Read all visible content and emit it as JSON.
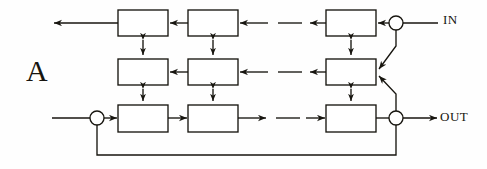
{
  "figure": {
    "panel_label": "A",
    "type": "block-diagram",
    "background": "#fefefe",
    "stroke_color": "#17150f",
    "fill_color": "#ffffff",
    "width": 487,
    "height": 169
  },
  "labels": {
    "input": "IN",
    "output": "OUT",
    "panel": "A"
  },
  "structure": {
    "rows": 3,
    "columns_drawn": 3,
    "row_names": [
      "top-row",
      "middle-row",
      "bottom-row"
    ],
    "top_row_direction": "right-to-left",
    "middle_row_direction": "right-to-left",
    "bottom_row_direction": "left-to-right",
    "ellipsis_marker": "dash",
    "vertical_links": "double-headed-arrow",
    "summing_junctions": 3
  },
  "geometry": {
    "box_width": 50,
    "box_height": 26,
    "row_y": [
      10,
      59,
      105
    ],
    "col_x": [
      118,
      188,
      326
    ],
    "junction_radius": 7,
    "junctions": [
      {
        "name": "input-sum",
        "cx": 396,
        "cy": 23
      },
      {
        "name": "feedback-sum",
        "cx": 97,
        "cy": 118
      },
      {
        "name": "output-sum",
        "cx": 396,
        "cy": 118
      }
    ]
  },
  "nodes": {
    "top": [
      "top-block-1",
      "top-block-2",
      "top-block-n"
    ],
    "middle": [
      "middle-block-1",
      "middle-block-2",
      "middle-block-n"
    ],
    "bottom": [
      "bottom-block-1",
      "bottom-block-2",
      "bottom-block-n"
    ]
  }
}
